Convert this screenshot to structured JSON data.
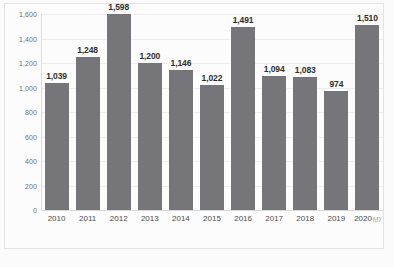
{
  "chart_data": {
    "type": "bar",
    "title": "",
    "xlabel": "",
    "ylabel": "",
    "x_unit_note": "(년)",
    "categories": [
      "2010",
      "2011",
      "2012",
      "2013",
      "2014",
      "2015",
      "2016",
      "2017",
      "2018",
      "2019",
      "2020"
    ],
    "values": [
      1039,
      1248,
      1598,
      1200,
      1146,
      1022,
      1491,
      1094,
      1083,
      974,
      1510
    ],
    "data_labels": [
      "1,039",
      "1,248",
      "1,598",
      "1,200",
      "1,146",
      "1,022",
      "1,491",
      "1,094",
      "1,083",
      "974",
      "1,510"
    ],
    "ylim": [
      0,
      1600
    ],
    "y_ticks": [
      0,
      200,
      400,
      600,
      800,
      1000,
      1200,
      1400,
      1600
    ],
    "y_tick_labels": [
      "0",
      "200",
      "400",
      "600",
      "800",
      "1,000",
      "1,200",
      "1,400",
      "1,600"
    ],
    "grid": true,
    "legend": "none",
    "bar_color": "#76767a",
    "gridline_color": "#ededed",
    "background_color": "#fcfcfc"
  }
}
